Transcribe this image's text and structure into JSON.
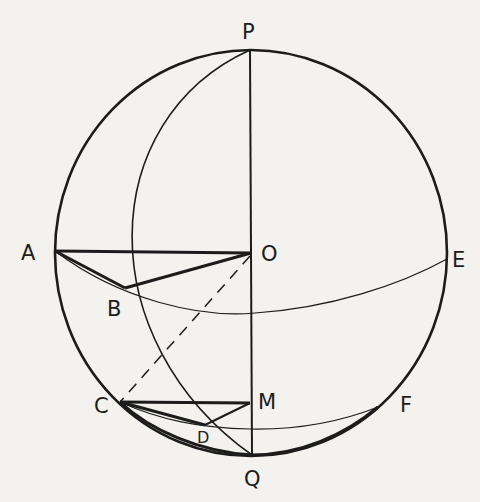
{
  "diagram": {
    "colors": {
      "background": "#f3f2ef",
      "ink": "#1c1c1c"
    },
    "labels": {
      "P": "P",
      "O": "O",
      "A": "A",
      "E": "E",
      "B": "B",
      "C": "C",
      "M": "M",
      "F": "F",
      "D": "D",
      "Q": "Q"
    },
    "points": {
      "P": [
        250,
        50
      ],
      "Q": [
        252,
        455
      ],
      "O": [
        251,
        253
      ],
      "A": [
        55,
        251
      ],
      "E": [
        447,
        259
      ],
      "B": [
        125,
        288
      ],
      "C": [
        120,
        402
      ],
      "M": [
        250,
        403
      ],
      "D": [
        205,
        425
      ],
      "F": [
        378,
        407
      ]
    },
    "edges": [
      {
        "from": "P",
        "to": "Q",
        "style": "solid"
      },
      {
        "from": "A",
        "to": "O",
        "style": "bold"
      },
      {
        "from": "A",
        "to": "B",
        "style": "bold"
      },
      {
        "from": "B",
        "to": "O",
        "style": "bold"
      },
      {
        "from": "O",
        "to": "C",
        "style": "dashed"
      },
      {
        "from": "C",
        "to": "M",
        "style": "bold"
      },
      {
        "from": "C",
        "to": "D",
        "style": "bold"
      },
      {
        "from": "D",
        "to": "M",
        "style": "solid"
      }
    ]
  }
}
